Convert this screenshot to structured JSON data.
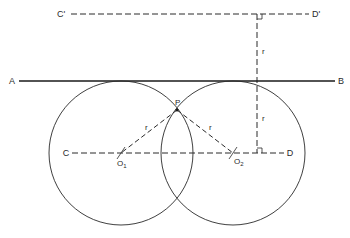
{
  "diagram": {
    "type": "geometric-construction",
    "colors": {
      "stroke": "#2a2a2a",
      "background": "#ffffff"
    },
    "labels": {
      "C_prime": "C'",
      "D_prime": "D'",
      "A": "A",
      "B": "B",
      "C": "C",
      "D": "D",
      "P": "P",
      "O1": "O",
      "O1_sub": "1",
      "O2": "O",
      "O2_sub": "2",
      "r_upper": "r",
      "r_lower": "r",
      "r_left": "r",
      "r_right": "r"
    },
    "elements": {
      "line_AB": {
        "style": "solid",
        "y": 81
      },
      "line_CprimeDprime": {
        "style": "dashed",
        "y": 14
      },
      "line_CD": {
        "style": "dashed",
        "y": 153
      },
      "perpendicular": {
        "style": "dashed",
        "x": 257,
        "right_angles": 2
      },
      "circle_O1": {
        "cx": 121,
        "cy": 153,
        "r": 72
      },
      "circle_O2": {
        "cx": 233,
        "cy": 153,
        "r": 72
      },
      "point_P": {
        "x": 177,
        "y": 110
      }
    }
  }
}
